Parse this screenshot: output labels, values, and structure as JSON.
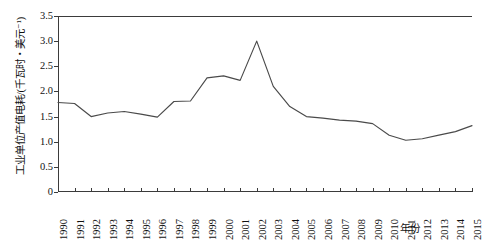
{
  "chart_data": {
    "type": "line",
    "title": "",
    "xlabel": "年份",
    "ylabel": "工业单位产值电耗/(千瓦时・美元⁻¹)",
    "x": [
      1990,
      1991,
      1992,
      1993,
      1994,
      1995,
      1996,
      1997,
      1998,
      1999,
      2000,
      2001,
      2002,
      2003,
      2004,
      2005,
      2006,
      2007,
      2008,
      2009,
      2010,
      2011,
      2012,
      2013,
      2014,
      2015
    ],
    "values": [
      1.78,
      1.76,
      1.5,
      1.57,
      1.6,
      1.55,
      1.49,
      1.8,
      1.81,
      2.27,
      2.31,
      2.22,
      3.0,
      2.1,
      1.7,
      1.5,
      1.47,
      1.43,
      1.41,
      1.36,
      1.13,
      1.03,
      1.06,
      1.13,
      1.2,
      1.32
    ],
    "series": [
      {
        "name": "工业单位产值电耗",
        "values": [
          1.78,
          1.76,
          1.5,
          1.57,
          1.6,
          1.55,
          1.49,
          1.8,
          1.81,
          2.27,
          2.31,
          2.22,
          3.0,
          2.1,
          1.7,
          1.5,
          1.47,
          1.43,
          1.41,
          1.36,
          1.13,
          1.03,
          1.06,
          1.13,
          1.2,
          1.32
        ],
        "color": "#4a4a4a"
      }
    ],
    "xlim": [
      1990,
      2015
    ],
    "ylim": [
      0,
      3.5
    ],
    "yticks": [
      0,
      0.5,
      1.0,
      1.5,
      2.0,
      2.5,
      3.0,
      3.5
    ],
    "ytick_labels": [
      "0",
      "0.5",
      "1.0",
      "1.5",
      "2.0",
      "2.5",
      "3.0",
      "3.5"
    ],
    "xtick_labels": [
      "1990",
      "1991",
      "1992",
      "1993",
      "1994",
      "1995",
      "1996",
      "1997",
      "1998",
      "1999",
      "2000",
      "2001",
      "2002",
      "2003",
      "2004",
      "2005",
      "2006",
      "2007",
      "2008",
      "2009",
      "2010",
      "2011",
      "2012",
      "2013",
      "2014",
      "2015"
    ],
    "grid": false,
    "legend": "none",
    "line_color": "#4a4a4a",
    "axis_color": "#3b3b3b",
    "background": "#ffffff"
  }
}
